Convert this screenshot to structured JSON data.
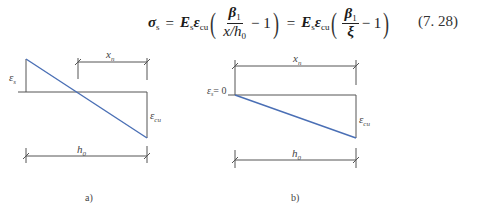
{
  "equation": {
    "lhs": "σ",
    "lhs_sub": "s",
    "eq1": "=",
    "E": "E",
    "E_sub": "s",
    "eps": "ε",
    "eps_sub": "cu",
    "beta": "β",
    "beta_sub": "1",
    "den1": "x/h",
    "den1_sub": "0",
    "minus_one": "− 1",
    "eq2": "=",
    "xi": "ξ",
    "number": "(7. 28)"
  },
  "diagrams": {
    "accent_color": "#4a6fb5",
    "line_color": "#555555",
    "a": {
      "caption": "a)",
      "eps_s_label": "ε",
      "eps_s_sub": "s",
      "eps_cu_label": "ε",
      "eps_cu_sub": "cu",
      "xn_label": "x",
      "xn_sub": "n",
      "h0_label": "h",
      "h0_sub": "0"
    },
    "b": {
      "caption": "b)",
      "eps_s_label": "ε",
      "eps_s_sub": "s",
      "eps_s_value": "= 0",
      "eps_cu_label": "ε",
      "eps_cu_sub": "cu",
      "xn_label": "x",
      "xn_sub": "n",
      "h0_label": "h",
      "h0_sub": "0"
    }
  }
}
